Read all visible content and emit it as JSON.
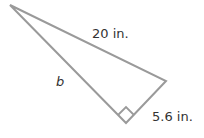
{
  "diagram": {
    "type": "right-triangle",
    "labels": {
      "hypotenuse": "20 in.",
      "leg_b": "b",
      "leg_short": "5.6 in."
    },
    "right_angle_marker": true,
    "colors": {
      "stroke": "#9a9a9a",
      "text": "#333333"
    }
  }
}
